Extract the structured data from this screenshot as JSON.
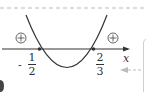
{
  "diagram": {
    "type": "sign-chart-parabola",
    "axis_label": "x",
    "roots": [
      {
        "value": "-1/2",
        "sign": "-",
        "numerator": "1",
        "denominator": "2"
      },
      {
        "value": "2/3",
        "sign": "",
        "numerator": "2",
        "denominator": "3"
      }
    ],
    "region_signs": {
      "left": "⊕",
      "right": "⊕"
    },
    "colors": {
      "curve": "#333333",
      "axis": "#333333",
      "dashed": "#bbbbbb"
    }
  }
}
